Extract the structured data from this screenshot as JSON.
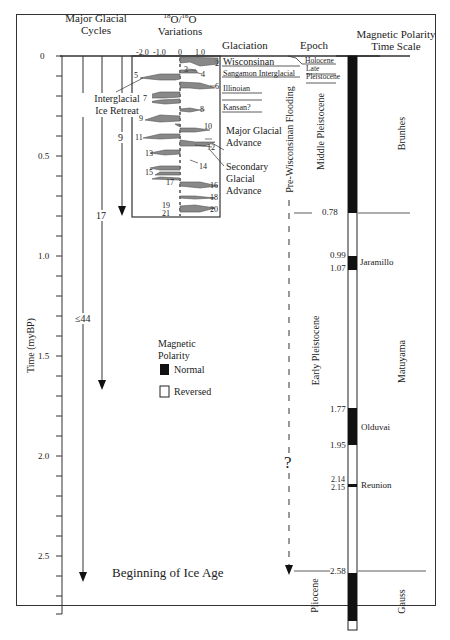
{
  "headers": {
    "major_glacial_cycles": [
      "Major Glacial",
      "Cycles"
    ],
    "o18_variations": {
      "sup1": "18",
      "o1": "O/",
      "sup2": "16",
      "o2": "O",
      "line2": "Variations"
    },
    "glaciation": "Glaciation",
    "epoch": "Epoch",
    "magnetic_polarity": [
      "Magnetic Polarity",
      "Time Scale"
    ]
  },
  "time_axis": {
    "label": "Time (myBP)",
    "ticks": [
      "0",
      "0.5",
      "1.0",
      "1.5",
      "2.0",
      "2.5"
    ],
    "range": [
      0,
      2.75
    ],
    "minor_step": 0.1
  },
  "o18_axis": {
    "ticks": [
      "-2.0",
      "-1.0",
      "0",
      "1.0"
    ]
  },
  "glacial_cycle_arrows": [
    {
      "label": "9",
      "end": 0.8
    },
    {
      "label": "17",
      "end": 1.7
    },
    {
      "label": "≤44",
      "end": 2.6
    }
  ],
  "annotations": {
    "interglacial": [
      "Interglacial",
      "Ice Retreat"
    ],
    "major_glacial": [
      "Major Glacial",
      "Advance"
    ],
    "secondary_glacial": [
      "Secondary",
      "Glacial",
      "Advance"
    ],
    "pre_wisconsinan": "Pre-Wisconsinan Flooding",
    "question": "?",
    "beginning": "Beginning of Ice Age"
  },
  "isotope_stages": [
    "2",
    "3",
    "4",
    "5",
    "6",
    "7",
    "8",
    "9",
    "10",
    "11",
    "12",
    "13",
    "14",
    "15",
    "16",
    "17",
    "18",
    "19",
    "20",
    "21"
  ],
  "glaciation_stages": [
    "Wisconsinan",
    "Sangamon Interglacial",
    "Illinoian",
    "Kansan?"
  ],
  "epochs": {
    "holocene": "Holocene",
    "late_pleistocene": [
      "Late",
      "Pleistocene"
    ],
    "middle_pleistocene": "Middle Pleistocene",
    "early_pleistocene": "Early Pleistocene",
    "pliocene": "Pliocene"
  },
  "polarity": {
    "boundaries": [
      "0.78",
      "0.99",
      "1.07",
      "1.77",
      "1.95",
      "2.14",
      "2.15",
      "2.58"
    ],
    "events": [
      "Jaramillo",
      "Olduvai",
      "Reunion"
    ],
    "chrons": [
      "Brunhes",
      "Matuyama",
      "Gauss"
    ]
  },
  "legend": {
    "title": [
      "Magnetic",
      "Polarity"
    ],
    "normal": "Normal",
    "reversed": "Reversed"
  },
  "colors": {
    "normal": "#111111",
    "isotope_fill": "#888888",
    "line": "#333333"
  }
}
